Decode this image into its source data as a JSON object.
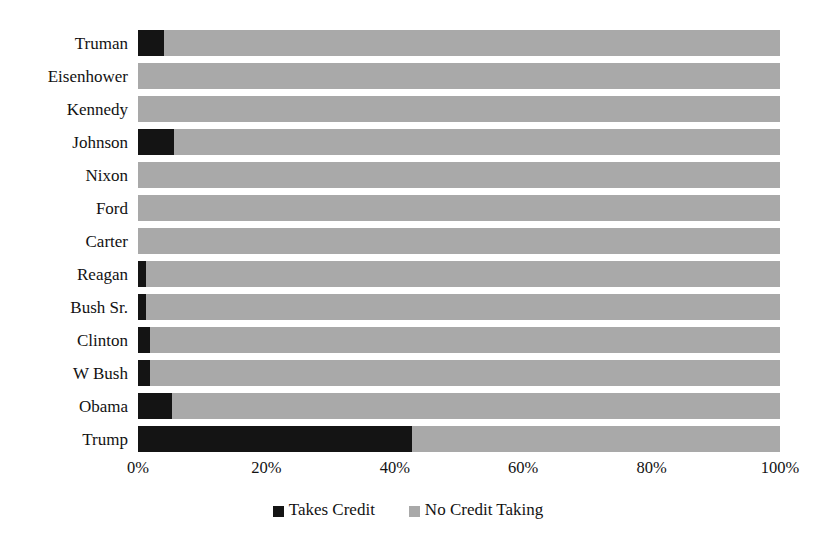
{
  "chart_data": {
    "type": "bar",
    "orientation": "horizontal",
    "stacked": true,
    "normalized": true,
    "title": "",
    "xlabel": "",
    "ylabel": "",
    "xlim": [
      0,
      100
    ],
    "grid": false,
    "legend_position": "bottom",
    "categories": [
      "Truman",
      "Eisenhower",
      "Kennedy",
      "Johnson",
      "Nixon",
      "Ford",
      "Carter",
      "Reagan",
      "Bush Sr.",
      "Clinton",
      "W Bush",
      "Obama",
      "Trump"
    ],
    "series": [
      {
        "name": "Takes Credit",
        "color": "#141414",
        "values": [
          4.0,
          0.0,
          0.0,
          5.6,
          0.0,
          0.0,
          0.0,
          1.2,
          1.2,
          1.9,
          1.9,
          5.3,
          42.7
        ]
      },
      {
        "name": "No Credit Taking",
        "color": "#a9a9a9",
        "values": [
          96.0,
          100.0,
          100.0,
          94.4,
          100.0,
          100.0,
          100.0,
          98.8,
          98.8,
          98.1,
          98.1,
          94.7,
          57.3
        ]
      }
    ],
    "xticks": [
      0,
      20,
      40,
      60,
      80,
      100
    ],
    "xticklabels": [
      "0%",
      "20%",
      "40%",
      "60%",
      "80%",
      "100%"
    ]
  },
  "legend": {
    "entries": [
      {
        "label": "Takes Credit",
        "swatch": "dark"
      },
      {
        "label": "No Credit Taking",
        "swatch": "light"
      }
    ]
  },
  "colors": {
    "takes_credit": "#141414",
    "no_credit_taking": "#a9a9a9",
    "background": "#ffffff",
    "text": "#121212"
  }
}
